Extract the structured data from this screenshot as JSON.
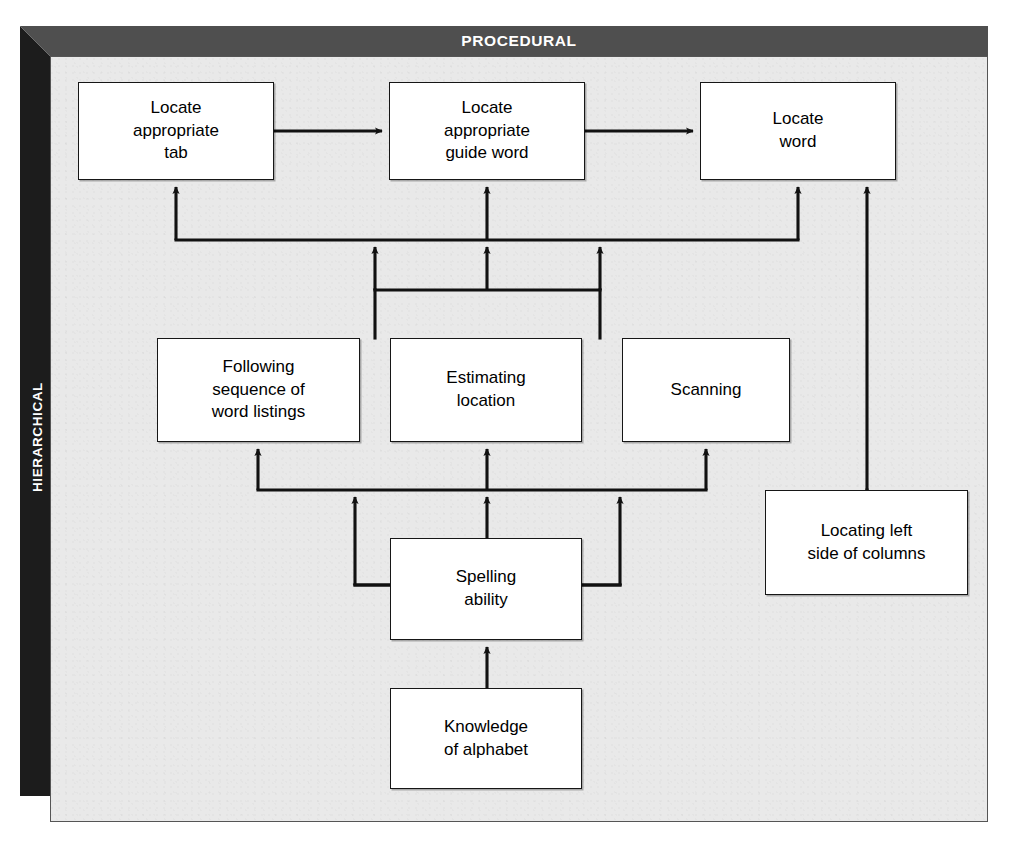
{
  "frame": {
    "top_band_label": "PROCEDURAL",
    "left_band_label": "HIERARCHICAL",
    "top_band_color": "#4f4f4f",
    "left_band_color": "#1c1c1c",
    "panel_color": "#e9e9e9"
  },
  "diagram": {
    "title": "PROCEDURAL",
    "nodes": [
      {
        "id": "locate-tab",
        "label": "Locate\nappropriate\ntab",
        "row": 1,
        "x": 78,
        "y": 82,
        "w": 196,
        "h": 98
      },
      {
        "id": "locate-guide-word",
        "label": "Locate\nappropriate\nguide word",
        "row": 1,
        "x": 389,
        "y": 82,
        "w": 196,
        "h": 98
      },
      {
        "id": "locate-word",
        "label": "Locate\nword",
        "row": 1,
        "x": 700,
        "y": 82,
        "w": 196,
        "h": 98
      },
      {
        "id": "following-seq",
        "label": "Following\nsequence of\nword listings",
        "row": 2,
        "x": 157,
        "y": 338,
        "w": 203,
        "h": 104
      },
      {
        "id": "estimating-loc",
        "label": "Estimating\nlocation",
        "row": 2,
        "x": 390,
        "y": 338,
        "w": 192,
        "h": 104
      },
      {
        "id": "scanning",
        "label": "Scanning",
        "row": 2,
        "x": 622,
        "y": 338,
        "w": 168,
        "h": 104
      },
      {
        "id": "spelling-ability",
        "label": "Spelling\nability",
        "row": 3,
        "x": 390,
        "y": 538,
        "w": 192,
        "h": 102
      },
      {
        "id": "locating-left",
        "label": "Locating left\nside of columns",
        "row": 3,
        "x": 765,
        "y": 490,
        "w": 203,
        "h": 105
      },
      {
        "id": "knowledge-alpha",
        "label": "Knowledge\nof alphabet",
        "row": 4,
        "x": 390,
        "y": 688,
        "w": 192,
        "h": 101
      }
    ],
    "edges": [
      {
        "from": "locate-tab",
        "to": "locate-guide-word",
        "kind": "horizontal-arrow"
      },
      {
        "from": "locate-guide-word",
        "to": "locate-word",
        "kind": "horizontal-arrow"
      },
      {
        "from": "following-seq",
        "to": "locate-tab",
        "kind": "bus-up"
      },
      {
        "from": "following-seq",
        "to": "locate-guide-word",
        "kind": "bus-up"
      },
      {
        "from": "estimating-loc",
        "to": "locate-guide-word",
        "kind": "bus-up"
      },
      {
        "from": "scanning",
        "to": "locate-word",
        "kind": "bus-up"
      },
      {
        "from": "spelling-ability",
        "to": "following-seq",
        "kind": "bus-up"
      },
      {
        "from": "spelling-ability",
        "to": "estimating-loc",
        "kind": "bus-up"
      },
      {
        "from": "spelling-ability",
        "to": "scanning",
        "kind": "bus-up"
      },
      {
        "from": "knowledge-alpha",
        "to": "spelling-ability",
        "kind": "vertical-arrow"
      },
      {
        "from": "locating-left",
        "to": "locate-word",
        "kind": "vertical-arrow-long"
      }
    ]
  }
}
